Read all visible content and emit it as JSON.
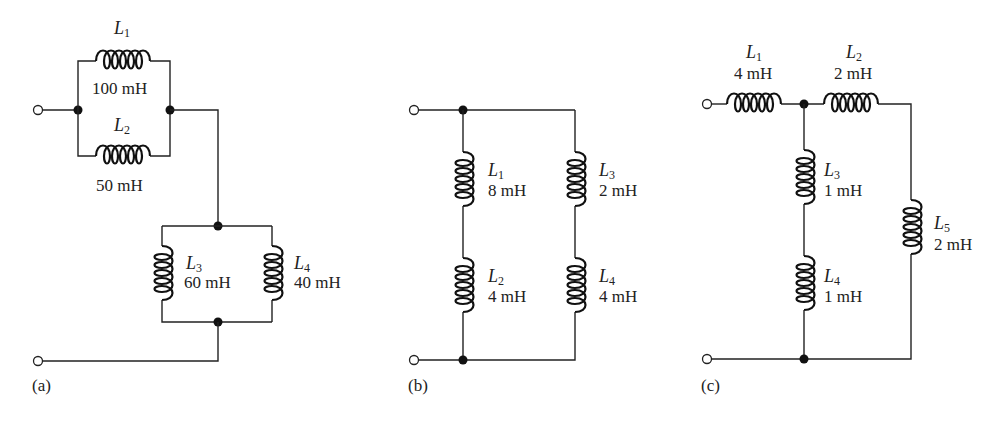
{
  "figure": {
    "circuits": [
      {
        "id": "a",
        "caption": "(a)",
        "inductors": [
          {
            "name": "L",
            "sub": "1",
            "value": "100 mH"
          },
          {
            "name": "L",
            "sub": "2",
            "value": "50 mH"
          },
          {
            "name": "L",
            "sub": "3",
            "value": "60 mH"
          },
          {
            "name": "L",
            "sub": "4",
            "value": "40 mH"
          }
        ]
      },
      {
        "id": "b",
        "caption": "(b)",
        "inductors": [
          {
            "name": "L",
            "sub": "1",
            "value": "8 mH"
          },
          {
            "name": "L",
            "sub": "2",
            "value": "4 mH"
          },
          {
            "name": "L",
            "sub": "3",
            "value": "2 mH"
          },
          {
            "name": "L",
            "sub": "4",
            "value": "4 mH"
          }
        ]
      },
      {
        "id": "c",
        "caption": "(c)",
        "inductors": [
          {
            "name": "L",
            "sub": "1",
            "value": "4 mH"
          },
          {
            "name": "L",
            "sub": "2",
            "value": "2 mH"
          },
          {
            "name": "L",
            "sub": "3",
            "value": "1 mH"
          },
          {
            "name": "L",
            "sub": "4",
            "value": "1 mH"
          },
          {
            "name": "L",
            "sub": "5",
            "value": "2 mH"
          }
        ]
      }
    ]
  }
}
